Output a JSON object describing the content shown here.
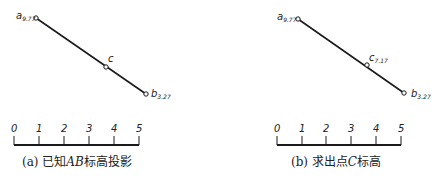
{
  "figures": [
    {
      "id": "a",
      "caption_prefix": "(a) 已知",
      "caption_italic": "AB",
      "caption_suffix": "标高投影",
      "points": {
        "a": {
          "letter": "a",
          "subscript": "9.77"
        },
        "c": {
          "letter": "c",
          "subscript": ""
        },
        "b": {
          "letter": "b",
          "subscript": "3.27"
        }
      },
      "scale_ticks": [
        "0",
        "1",
        "2",
        "3",
        "4",
        "5"
      ]
    },
    {
      "id": "b",
      "caption_prefix": "(b) 求出点",
      "caption_italic": "C",
      "caption_suffix": "标高",
      "points": {
        "a": {
          "letter": "a",
          "subscript": "9.77"
        },
        "c": {
          "letter": "c",
          "subscript": "7.17"
        },
        "b": {
          "letter": "b",
          "subscript": "3.27"
        }
      },
      "scale_ticks": [
        "0",
        "1",
        "2",
        "3",
        "4",
        "5"
      ]
    }
  ],
  "colors": {
    "line": "#1a1a1a",
    "background": "#ffffff"
  }
}
